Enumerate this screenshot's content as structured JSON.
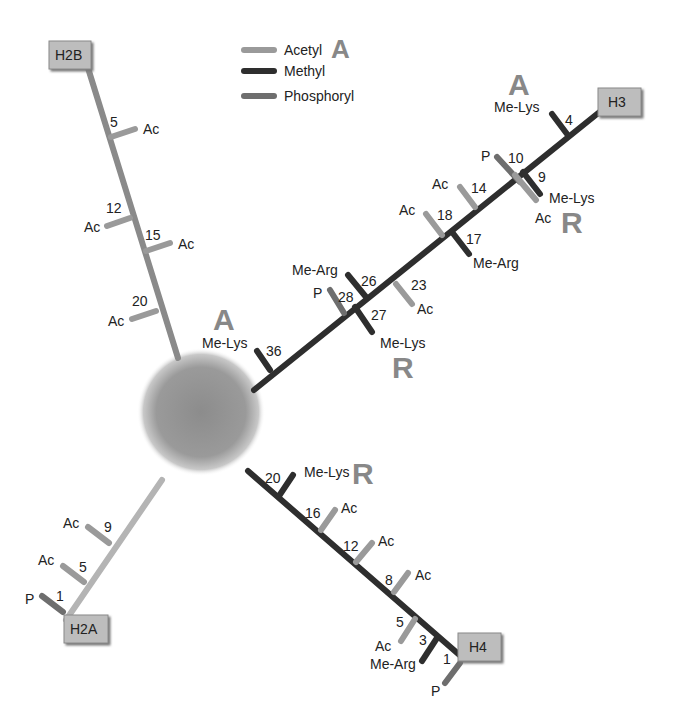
{
  "colors": {
    "acetyl": "#9a9a9a",
    "methyl": "#2e2e2e",
    "phosphoryl": "#6e6e6e",
    "h2a_tail": "#b4b4b4",
    "h2b_tail": "#8a8a8a",
    "box_fill": "#bdbdbd",
    "box_border": "#8a8a8a",
    "mark_letter": "#8a8a8a"
  },
  "legend": {
    "items": [
      {
        "label": "Acetyl",
        "type": "acetyl"
      },
      {
        "label": "Methyl",
        "type": "methyl"
      },
      {
        "label": "Phosphoryl",
        "type": "phosphoryl"
      }
    ],
    "activation_mark": "A"
  },
  "nucleosome": {
    "label": ""
  },
  "histones": {
    "H2B": {
      "label": "H2B",
      "sites": [
        {
          "position": "5",
          "modification": "Ac"
        },
        {
          "position": "12",
          "modification": "Ac"
        },
        {
          "position": "15",
          "modification": "Ac"
        },
        {
          "position": "20",
          "modification": "Ac"
        }
      ]
    },
    "H3": {
      "label": "H3",
      "sites": [
        {
          "position": "4",
          "modification": "Me-Lys",
          "effect": "A"
        },
        {
          "position": "9",
          "modification": "Me-Lys",
          "effect": "R"
        },
        {
          "position": "9",
          "modification": "Ac"
        },
        {
          "position": "10",
          "modification": "P"
        },
        {
          "position": "14",
          "modification": "Ac"
        },
        {
          "position": "17",
          "modification": "Me-Arg"
        },
        {
          "position": "18",
          "modification": "Ac"
        },
        {
          "position": "23",
          "modification": "Ac"
        },
        {
          "position": "26",
          "modification": "Me-Arg"
        },
        {
          "position": "27",
          "modification": "Me-Lys",
          "effect": "R"
        },
        {
          "position": "28",
          "modification": "P"
        },
        {
          "position": "36",
          "modification": "Me-Lys",
          "effect": "A"
        }
      ]
    },
    "H2A": {
      "label": "H2A",
      "sites": [
        {
          "position": "1",
          "modification": "P"
        },
        {
          "position": "5",
          "modification": "Ac"
        },
        {
          "position": "9",
          "modification": "Ac"
        }
      ]
    },
    "H4": {
      "label": "H4",
      "sites": [
        {
          "position": "1",
          "modification": "P"
        },
        {
          "position": "3",
          "modification": "Me-Arg"
        },
        {
          "position": "5",
          "modification": "Ac"
        },
        {
          "position": "8",
          "modification": "Ac"
        },
        {
          "position": "12",
          "modification": "Ac"
        },
        {
          "position": "16",
          "modification": "Ac"
        },
        {
          "position": "20",
          "modification": "Me-Lys",
          "effect": "R"
        }
      ]
    }
  },
  "text": {
    "ac": "Ac",
    "p": "P",
    "me_lys": "Me-Lys",
    "me_arg": "Me-Arg",
    "mark_a": "A",
    "mark_r": "R",
    "h2b_5": "5",
    "h2b_12": "12",
    "h2b_15": "15",
    "h2b_20": "20",
    "h3_4": "4",
    "h3_9": "9",
    "h3_10": "10",
    "h3_14": "14",
    "h3_17": "17",
    "h3_18": "18",
    "h3_23": "23",
    "h3_26": "26",
    "h3_27": "27",
    "h3_28": "28",
    "h3_36": "36",
    "h2a_1": "1",
    "h2a_5": "5",
    "h2a_9": "9",
    "h4_1": "1",
    "h4_3": "3",
    "h4_5": "5",
    "h4_8": "8",
    "h4_12": "12",
    "h4_16": "16",
    "h4_20": "20"
  }
}
